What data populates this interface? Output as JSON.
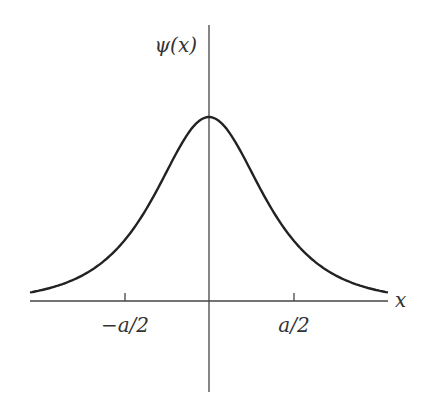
{
  "figure": {
    "y_axis_label": "ψ(x)",
    "x_axis_label": "x",
    "ticks": [
      {
        "label": "−a/2",
        "value": -0.5
      },
      {
        "label": "a/2",
        "value": 0.5
      }
    ]
  },
  "chart_data": {
    "type": "line",
    "title": "",
    "xlabel": "x",
    "ylabel": "ψ(x)",
    "x_ticks": [
      "−a/2",
      "a/2"
    ],
    "x": [
      -1.06,
      -0.8,
      -0.6,
      -0.5,
      -0.4,
      -0.2,
      0,
      0.2,
      0.4,
      0.5,
      0.6,
      0.8,
      1.06
    ],
    "values": [
      0.055,
      0.13,
      0.25,
      0.35,
      0.48,
      0.8,
      1.0,
      0.8,
      0.48,
      0.35,
      0.25,
      0.13,
      0.055
    ],
    "grid": false
  }
}
